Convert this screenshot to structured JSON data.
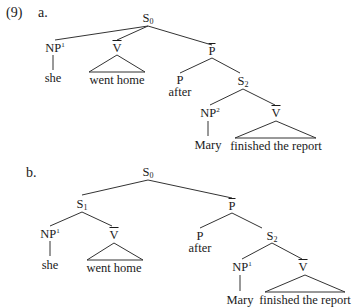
{
  "example_number": "(9)",
  "trees": [
    {
      "label": "a.",
      "nodes": {
        "root": {
          "cat": "S",
          "sub": "0"
        },
        "np": {
          "cat": "NP",
          "sup": "1"
        },
        "np_word": "she",
        "vbar": {
          "cat": "V"
        },
        "vbar_words": "went home",
        "pbar": {
          "cat": "P"
        },
        "p": {
          "cat": "P"
        },
        "p_word": "after",
        "s2": {
          "cat": "S",
          "sub": "2"
        },
        "np2": {
          "cat": "NP",
          "sup": "2"
        },
        "np2_word": "Mary",
        "vbar2": {
          "cat": "V"
        },
        "vbar2_words": "finished the report"
      }
    },
    {
      "label": "b.",
      "nodes": {
        "root": {
          "cat": "S",
          "sub": "0"
        },
        "s1": {
          "cat": "S",
          "sub": "1"
        },
        "np": {
          "cat": "NP",
          "sup": "1"
        },
        "np_word": "she",
        "vbar": {
          "cat": "V"
        },
        "vbar_words": "went home",
        "pbar": {
          "cat": "P"
        },
        "p": {
          "cat": "P"
        },
        "p_word": "after",
        "s2": {
          "cat": "S",
          "sub": "2"
        },
        "np2": {
          "cat": "NP",
          "sup": "1"
        },
        "np2_word": "Mary",
        "vbar2": {
          "cat": "V"
        },
        "vbar2_words": "finished the report"
      }
    }
  ]
}
